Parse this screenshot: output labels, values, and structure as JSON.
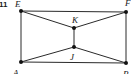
{
  "figure": {
    "exercise_number": "11",
    "points": {
      "E": {
        "label": "E",
        "x": 21,
        "y": 11
      },
      "F": {
        "label": "F",
        "x": 126,
        "y": 12
      },
      "A": {
        "label": "A",
        "x": 21,
        "y": 62
      },
      "B": {
        "label": "B",
        "x": 126,
        "y": 63
      },
      "K": {
        "label": "K",
        "x": 74,
        "y": 28
      },
      "J": {
        "label": "J",
        "x": 74,
        "y": 47
      }
    },
    "segments": [
      [
        "E",
        "F"
      ],
      [
        "F",
        "B"
      ],
      [
        "B",
        "A"
      ],
      [
        "A",
        "E"
      ],
      [
        "E",
        "K"
      ],
      [
        "F",
        "K"
      ],
      [
        "K",
        "J"
      ],
      [
        "A",
        "J"
      ],
      [
        "B",
        "J"
      ]
    ]
  }
}
